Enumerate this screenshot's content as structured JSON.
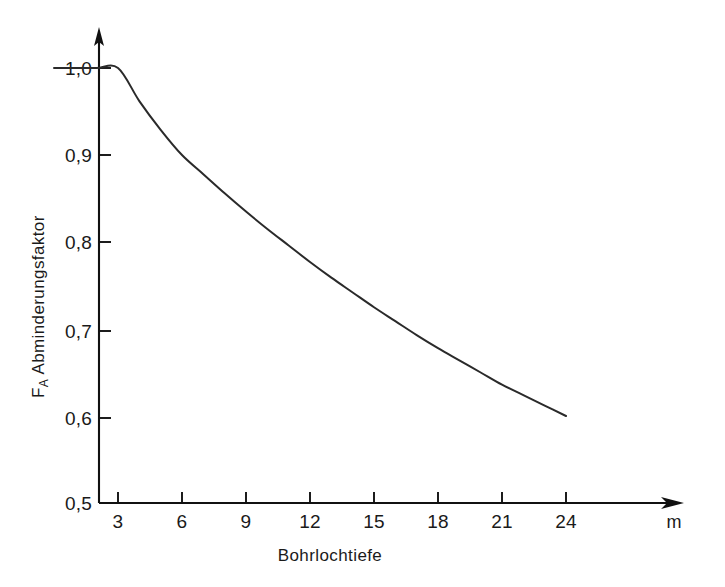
{
  "figure": {
    "background_color": "#ffffff",
    "line_color": "#2a2a2a",
    "axis_color": "#111111"
  },
  "axes": {
    "y_title_main": "Abminderungsfaktor",
    "y_title_symbol": "F",
    "y_title_subscript": "A",
    "x_title": "Bohrlochtiefe",
    "x_unit": "m",
    "y_tick_labels": [
      "0,5",
      "0,6",
      "0,7",
      "0,8",
      "0,9",
      "1,0"
    ],
    "x_tick_labels": [
      "3",
      "6",
      "9",
      "12",
      "15",
      "18",
      "21",
      "24"
    ]
  },
  "chart_data": {
    "type": "line",
    "title": "",
    "subtitle": "",
    "xlabel": "Bohrlochtiefe",
    "ylabel": "F_A Abminderungsfaktor",
    "xunit": "m",
    "xlim": [
      0,
      27
    ],
    "ylim": [
      0.5,
      1.0
    ],
    "x_ticks": [
      3,
      6,
      9,
      12,
      15,
      18,
      21,
      24
    ],
    "y_ticks": [
      0.5,
      0.6,
      0.7,
      0.8,
      0.9,
      1.0
    ],
    "grid": false,
    "legend": null,
    "legend_position": "none",
    "annotations": [],
    "series": [
      {
        "name": "Abminderungsfaktor F_A",
        "x": [
          0,
          1,
          2,
          3,
          4,
          5,
          6,
          7,
          8,
          9,
          10,
          11,
          12,
          13,
          14,
          15,
          16,
          17,
          18,
          19,
          20,
          21,
          22,
          23,
          24
        ],
        "values": [
          1.0,
          1.0,
          1.0,
          1.0,
          0.962,
          0.929,
          0.9,
          0.878,
          0.856,
          0.835,
          0.815,
          0.796,
          0.777,
          0.759,
          0.742,
          0.725,
          0.709,
          0.693,
          0.678,
          0.664,
          0.65,
          0.636,
          0.624,
          0.612,
          0.6
        ]
      }
    ]
  }
}
